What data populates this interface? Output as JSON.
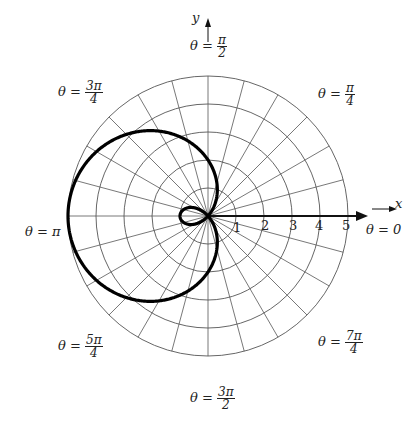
{
  "chart_data": {
    "type": "line",
    "subtype": "polar",
    "title": "",
    "equation_implied": "r = 2 - 3cos(theta)",
    "xlabel": "x",
    "ylabel": "y",
    "radial_ticks": [
      "1",
      "2",
      "3",
      "4",
      "5"
    ],
    "rlim": [
      0,
      5
    ],
    "angle_gridlines_deg_step": 15,
    "angle_labels": [
      {
        "num": "",
        "den": "",
        "text": "θ = 0"
      },
      {
        "num": "π",
        "den": "4",
        "prefix": "θ ="
      },
      {
        "num": "π",
        "den": "2",
        "prefix": "θ ="
      },
      {
        "num": "3π",
        "den": "4",
        "prefix": "θ ="
      },
      {
        "text": "θ = π"
      },
      {
        "num": "5π",
        "den": "4",
        "prefix": "θ ="
      },
      {
        "num": "3π",
        "den": "2",
        "prefix": "θ ="
      },
      {
        "num": "7π",
        "den": "4",
        "prefix": "θ ="
      }
    ],
    "grid": true
  },
  "labels": {
    "x": "x",
    "y": "y",
    "t0": "θ = 0",
    "tpi": "θ = π",
    "prefix": "θ =",
    "pi4n": "π",
    "pi4d": "4",
    "pi2n": "π",
    "pi2d": "2",
    "p34n": "3π",
    "p34d": "4",
    "p54n": "5π",
    "p54d": "4",
    "p32n": "3π",
    "p32d": "2",
    "p74n": "7π",
    "p74d": "4",
    "r1": "1",
    "r2": "2",
    "r3": "3",
    "r4": "4",
    "r5": "5"
  }
}
